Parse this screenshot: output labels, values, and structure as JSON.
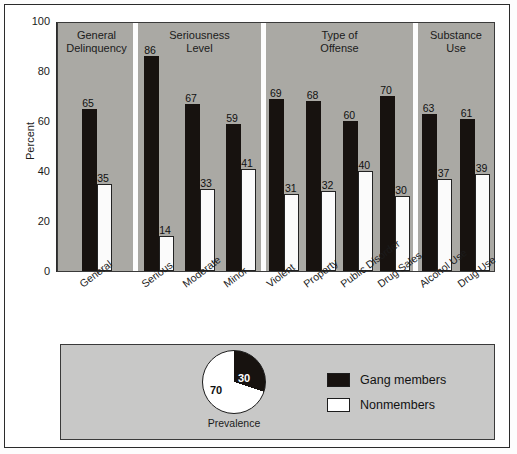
{
  "chart_data": {
    "type": "bar",
    "title": "",
    "xlabel": "",
    "ylabel": "Percent",
    "ylim": [
      0,
      100
    ],
    "yticks": [
      0,
      20,
      40,
      60,
      80,
      100
    ],
    "grid": false,
    "legend_position": "bottom-right",
    "series": [
      {
        "name": "Gang members",
        "color": "#17120f",
        "values": [
          65,
          86,
          67,
          59,
          69,
          68,
          60,
          70,
          63,
          61
        ]
      },
      {
        "name": "Nonmembers",
        "color": "#ffffff",
        "values": [
          35,
          14,
          33,
          41,
          31,
          32,
          40,
          30,
          37,
          39
        ]
      }
    ],
    "categories": [
      "General",
      "Serious",
      "Moderate",
      "Minor",
      "Violent",
      "Property",
      "Public Disorder",
      "Drug Sales",
      "Alcohol Use",
      "Drug Use"
    ],
    "groups": [
      {
        "title": "General\nDelinquency",
        "categories": [
          "General"
        ]
      },
      {
        "title": "Seriousness\nLevel",
        "categories": [
          "Serious",
          "Moderate",
          "Minor"
        ]
      },
      {
        "title": "Type of\nOffense",
        "categories": [
          "Violent",
          "Property",
          "Public Disorder",
          "Drug Sales"
        ]
      },
      {
        "title": "Substance\nUse",
        "categories": [
          "Alcohol Use",
          "Drug Use"
        ]
      }
    ],
    "inset_pie": {
      "type": "pie",
      "caption": "Prevalence",
      "labels": [
        "Gang members",
        "Nonmembers"
      ],
      "values": [
        30,
        70
      ],
      "value_labels": [
        "30",
        "70"
      ],
      "colors": [
        "#17120f",
        "#ffffff"
      ]
    }
  },
  "axis": {
    "y_label": "Percent",
    "y_ticks": [
      "100",
      "80",
      "60",
      "40",
      "20",
      "0"
    ]
  },
  "panels": [
    {
      "title_line1": "General",
      "title_line2": "Delinquency"
    },
    {
      "title_line1": "Seriousness",
      "title_line2": "Level"
    },
    {
      "title_line1": "Type of",
      "title_line2": "Offense"
    },
    {
      "title_line1": "Substance",
      "title_line2": "Use"
    }
  ],
  "bars": [
    {
      "category": "General",
      "gang": "65",
      "non": "35"
    },
    {
      "category": "Serious",
      "gang": "86",
      "non": "14"
    },
    {
      "category": "Moderate",
      "gang": "67",
      "non": "33"
    },
    {
      "category": "Minor",
      "gang": "59",
      "non": "41"
    },
    {
      "category": "Violent",
      "gang": "69",
      "non": "31"
    },
    {
      "category": "Property",
      "gang": "68",
      "non": "32"
    },
    {
      "category": "Public Disorder",
      "gang": "60",
      "non": "40"
    },
    {
      "category": "Drug Sales",
      "gang": "70",
      "non": "30"
    },
    {
      "category": "Alcohol Use",
      "gang": "63",
      "non": "37"
    },
    {
      "category": "Drug Use",
      "gang": "61",
      "non": "39"
    }
  ],
  "pie": {
    "black_value": "30",
    "white_value": "70",
    "caption": "Prevalence"
  },
  "legend": {
    "items": [
      {
        "label": "Gang members",
        "swatch": "gang"
      },
      {
        "label": "Nonmembers",
        "swatch": "non"
      }
    ]
  },
  "colors": {
    "gang": "#17120f",
    "nonmember": "#ffffff",
    "plot_background": "#aaa9a4",
    "panel_background": "#c8c8c7",
    "frame": "#2b2b2b"
  }
}
